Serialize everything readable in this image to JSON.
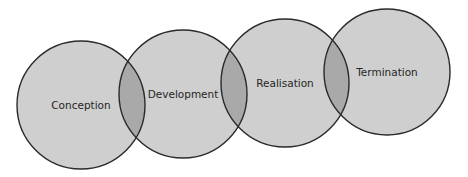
{
  "diagram": {
    "type": "overlapping-circles",
    "colors": {
      "background": "#ffffff",
      "circle_fill": "#cfcfcf",
      "overlap_fill": "#a9a9a9",
      "stroke": "#2a2a2a",
      "text": "#262626"
    },
    "stages": [
      {
        "label": "Conception",
        "cx": 81,
        "cy": 105,
        "r": 64
      },
      {
        "label": "Development",
        "cx": 183,
        "cy": 94,
        "r": 64
      },
      {
        "label": "Realisation",
        "cx": 285,
        "cy": 83,
        "r": 64
      },
      {
        "label": "Termination",
        "cx": 387,
        "cy": 72,
        "r": 63
      }
    ]
  }
}
